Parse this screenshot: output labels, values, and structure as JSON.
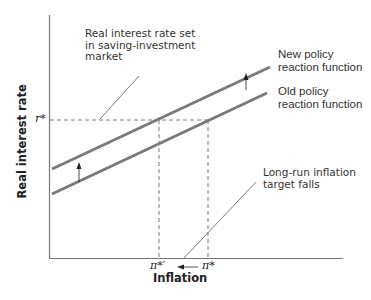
{
  "figure": {
    "top_fragment": "y-making strategy",
    "y_axis_title": "Real interest rate",
    "x_axis_title": "Inflation",
    "ticks": {
      "r_star": "r*",
      "pi_star_prime": "π*′",
      "pi_star": "π*"
    },
    "curves": {
      "new": "New policy reaction function",
      "new_line1": "New policy",
      "new_line2": "reaction function",
      "old": "Old policy reaction function",
      "old_line1": "Old policy",
      "old_line2": "reaction function"
    },
    "callouts": {
      "saving_investment_line1": "Real interest rate set",
      "saving_investment_line2": "in saving-investment",
      "saving_investment_line3": "market",
      "inflation_target_line1": "Long-run inflation",
      "inflation_target_line2": "target falls"
    },
    "colors": {
      "axis": "#666666",
      "curve": "#7a7a7a",
      "dashed": "#555555",
      "text": "#222222"
    }
  }
}
